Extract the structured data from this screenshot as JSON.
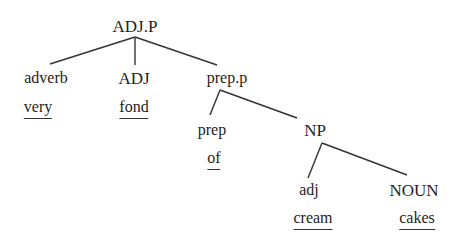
{
  "diagram": {
    "type": "syntax-tree",
    "root": {
      "label": "ADJ.P",
      "children": [
        {
          "label": "adverb",
          "word": "very"
        },
        {
          "label": "ADJ",
          "word": "fond"
        },
        {
          "label": "prep.p",
          "children": [
            {
              "label": "prep",
              "word": "of"
            },
            {
              "label": "NP",
              "children": [
                {
                  "label": "adj",
                  "word": "cream"
                },
                {
                  "label": "NOUN",
                  "word": "cakes"
                }
              ]
            }
          ]
        }
      ]
    }
  },
  "nodes": {
    "adjp": "ADJ.P",
    "adverb": "adverb",
    "adj_upper": "ADJ",
    "prepp": "prep.p",
    "prep": "prep",
    "np": "NP",
    "adj_lower": "adj",
    "noun": "NOUN"
  },
  "words": {
    "very": "very",
    "fond": "fond",
    "of": "of",
    "cream": "cream",
    "cakes": "cakes"
  }
}
